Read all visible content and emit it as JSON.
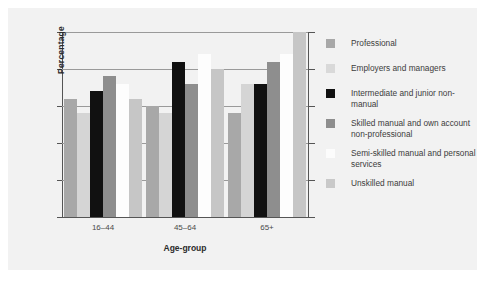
{
  "chart_data": {
    "type": "bar",
    "title": "",
    "subtitle": "",
    "xlabel": "Age-group",
    "ylabel": "Percentage",
    "categories": [
      "16–44",
      "45–64",
      "65+"
    ],
    "ylim": [
      0,
      25
    ],
    "yticks": [
      0,
      5,
      10,
      15,
      20,
      25
    ],
    "ytick_labels": [
      "0",
      "5",
      "10",
      "15",
      "20",
      "25"
    ],
    "grid": true,
    "grid_axis": "y",
    "legend_position": "right",
    "series": [
      {
        "name": "Professional",
        "color": "#a8a8a8",
        "values": [
          16,
          15,
          14
        ]
      },
      {
        "name": "Employers and managers",
        "color": "#d5d5d5",
        "values": [
          14,
          14,
          18
        ]
      },
      {
        "name": "Intermediate and junior non-manual",
        "color": "#111111",
        "values": [
          17,
          21,
          18
        ]
      },
      {
        "name": "Skilled manual and own account non-professional",
        "color": "#8e8e8e",
        "values": [
          19,
          18,
          21
        ]
      },
      {
        "name": "Semi-skilled manual and personal services",
        "color": "#fdfdfd",
        "values": [
          18,
          22,
          22
        ]
      },
      {
        "name": "Unskilled manual",
        "color": "#c6c6c6",
        "values": [
          16,
          20,
          25
        ]
      }
    ]
  },
  "axes": {
    "y_title": "Percentage",
    "x_title": "Age-group",
    "y_tick_labels": [
      "25",
      "20",
      "15",
      "10",
      "5",
      "0"
    ],
    "x_tick_labels": [
      "16–44",
      "45–64",
      "65+"
    ]
  },
  "legend": {
    "items": [
      {
        "label": "Professional",
        "swatch": "#a8a8a8"
      },
      {
        "label": "Employers and managers",
        "swatch": "#d9d9d9"
      },
      {
        "label": "Intermediate and junior non-manual",
        "swatch": "#111111"
      },
      {
        "label": "Skilled manual and own account non-professional",
        "swatch": "#8e8e8e"
      },
      {
        "label": "Semi-skilled manual and personal services",
        "swatch": "#fcfcfc"
      },
      {
        "label": "Unskilled manual",
        "swatch": "#c9c9c9"
      }
    ]
  },
  "colors": {
    "panel_background": "#f2f2f2",
    "axis": "#555555",
    "gridline": "#9a9a9a",
    "text": "#3c3c3c"
  }
}
